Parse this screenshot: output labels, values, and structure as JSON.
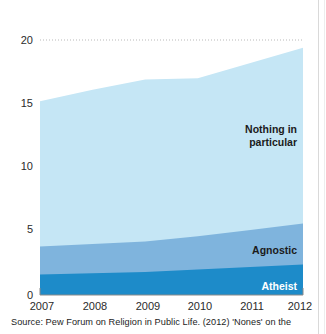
{
  "chart_data": {
    "type": "area",
    "title": "",
    "subtitle": "",
    "xlabel": "",
    "ylabel": "",
    "stacked": true,
    "grid": "dotted gridline at y=20 only",
    "legend": "inline labels at right edge of each band",
    "x": [
      2007,
      2008,
      2009,
      2010,
      2011,
      2012
    ],
    "xtick_labels": [
      "2007",
      "2008",
      "2009",
      "2010",
      "2011",
      "2012"
    ],
    "ytick_labels": [
      "0",
      "5",
      "10",
      "15",
      "20"
    ],
    "yticks": [
      0,
      5,
      10,
      15,
      20
    ],
    "ylim": [
      0,
      20
    ],
    "xlim": [
      2007,
      2012
    ],
    "series": [
      {
        "name": "Atheist",
        "label": "Atheist",
        "color": "#1d8bc9",
        "label_color": "#ffffff",
        "values": [
          1.6,
          1.7,
          1.8,
          2.0,
          2.2,
          2.4
        ]
      },
      {
        "name": "Agnostic",
        "label": "Agnostic",
        "color": "#7fb4dd",
        "label_color": "#1b1b1b",
        "values": [
          2.2,
          2.3,
          2.4,
          2.6,
          2.9,
          3.2
        ]
      },
      {
        "name": "Nothing in particular",
        "label": "Nothing in particular",
        "label_line_1": "Nothing in",
        "label_line_2": "particular",
        "color": "#c5e6f5",
        "label_color": "#1b1b1b",
        "values": [
          11.4,
          12.1,
          12.7,
          12.4,
          13.1,
          13.8
        ]
      }
    ],
    "totals": [
      15.2,
      16.1,
      16.9,
      17.0,
      18.2,
      19.4
    ],
    "gridline_color": "#b9b9b9",
    "axis_color": "#8a8a8a"
  },
  "source": {
    "text": "Source: Pew Forum on Religion in Public Life. (2012) 'Nones' on the"
  }
}
